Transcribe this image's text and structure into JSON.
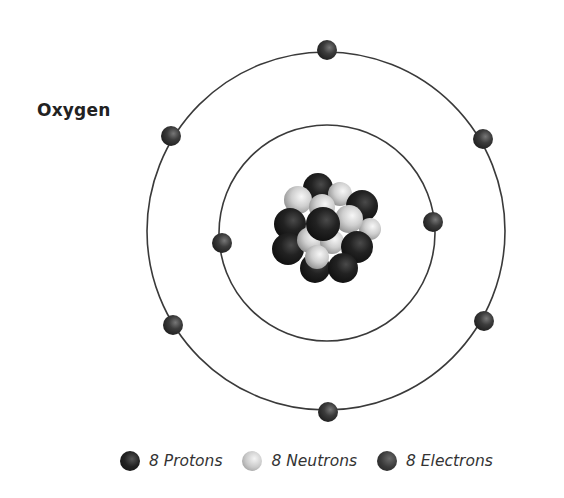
{
  "diagram": {
    "title": "Oxygen",
    "type": "bohr-atom-model",
    "element": "Oxygen",
    "orbits": [
      {
        "name": "inner-shell",
        "cx": 327,
        "cy": 233,
        "r": 108,
        "electrons": [
          {
            "x": 222,
            "y": 243
          },
          {
            "x": 433,
            "y": 222
          }
        ]
      },
      {
        "name": "outer-shell",
        "cx": 326,
        "cy": 231,
        "r": 180,
        "electrons": [
          {
            "x": 327,
            "y": 50
          },
          {
            "x": 171,
            "y": 136
          },
          {
            "x": 483,
            "y": 139
          },
          {
            "x": 173,
            "y": 325
          },
          {
            "x": 484,
            "y": 321
          },
          {
            "x": 328,
            "y": 412
          }
        ]
      }
    ],
    "nucleus": {
      "cx": 326,
      "cy": 230,
      "protons": 8,
      "neutrons": 8
    },
    "colors": {
      "orbit": "#3a3a3a",
      "proton": "#1e1e1e",
      "neutron": "#d0d0d0",
      "electron": "#3a3a3a"
    }
  },
  "legend": [
    {
      "label": "8 Protons",
      "kind": "proton"
    },
    {
      "label": "8 Neutrons",
      "kind": "neutron"
    },
    {
      "label": "8 Electrons",
      "kind": "electron"
    }
  ]
}
